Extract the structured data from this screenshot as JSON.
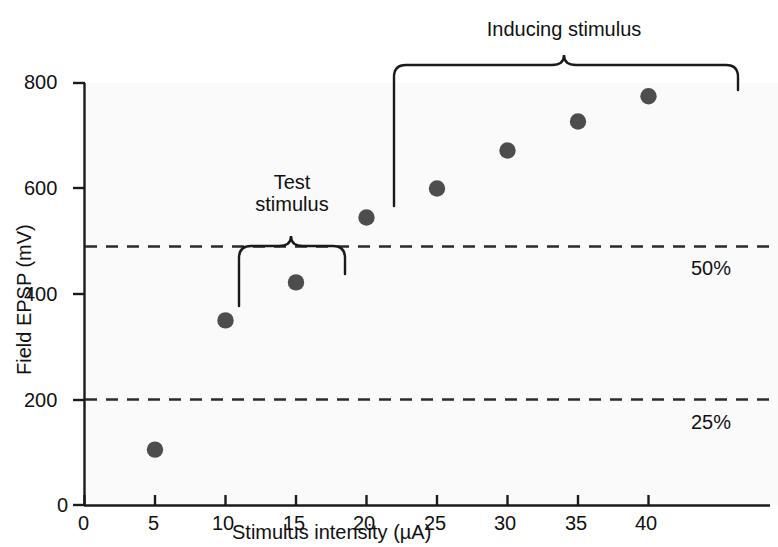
{
  "figure": {
    "background_color": "#ffffff",
    "plot_background_color": "#fafafa",
    "axis_color": "#1a1a1a",
    "marker_color": "#4d4d4d",
    "dash_color": "#2b2b2b"
  },
  "chart_data": {
    "type": "scatter",
    "title": "",
    "xlabel": "Stimulus intensity (µA)",
    "ylabel": "Field EPSP (mV)",
    "xlim": [
      0,
      42
    ],
    "ylim": [
      0,
      800
    ],
    "xticks": [
      0,
      5,
      10,
      15,
      20,
      25,
      30,
      35,
      40
    ],
    "xticklabels": [
      "0",
      "5",
      "10",
      "15",
      "20",
      "25",
      "30",
      "35",
      "40"
    ],
    "yticks": [
      0,
      200,
      400,
      600,
      800
    ],
    "yticklabels": [
      "0",
      "200",
      "400",
      "600",
      "800"
    ],
    "grid": false,
    "legend": null,
    "series": [
      {
        "name": "Field EPSP",
        "marker": "filled-circle",
        "color": "#4d4d4d",
        "x": [
          5,
          10,
          15,
          20,
          25,
          30,
          35,
          40
        ],
        "values": [
          105,
          350,
          422,
          545,
          600,
          672,
          727,
          775
        ]
      }
    ],
    "reference_lines": [
      {
        "label": "50%",
        "y": 490,
        "style": "dashed"
      },
      {
        "label": "25%",
        "y": 200,
        "style": "dashed"
      }
    ],
    "annotations": [
      {
        "label": "Test stimulus",
        "text_line_1": "Test",
        "text_line_2": "stimulus",
        "brace": "down",
        "x_start": 11,
        "x_end": 18.5
      },
      {
        "label": "Inducing stimulus",
        "text_line_1": "Inducing stimulus",
        "text_line_2": "",
        "brace": "down",
        "x_start": 22,
        "x_end": 46.5
      }
    ]
  },
  "axis": {
    "x_title": "Stimulus intensity (µA)",
    "y_title": "Field EPSP (mV)",
    "x_tick_labels": [
      "0",
      "5",
      "10",
      "15",
      "20",
      "25",
      "30",
      "35",
      "40"
    ],
    "y_tick_labels": [
      "800",
      "600",
      "400",
      "200",
      "0"
    ]
  },
  "labels": {
    "pct_50": "50%",
    "pct_25": "25%",
    "test_stimulus_line1": "Test",
    "test_stimulus_line2": "stimulus",
    "inducing_stimulus": "Inducing stimulus"
  }
}
